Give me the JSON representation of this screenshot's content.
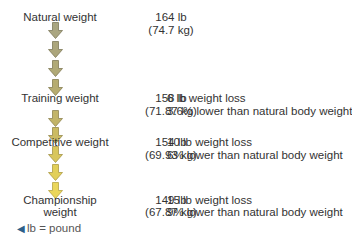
{
  "stages": [
    {
      "label": "Natural weight",
      "lb": "164 lb",
      "kg": "(74.7 kg)",
      "loss": "",
      "pct": ""
    },
    {
      "label": "Training weight",
      "lb": "158 lb",
      "kg": "(71.87 kg)",
      "loss": "6 lb weight loss",
      "pct": "3.6% lower than natural body weight"
    },
    {
      "label": "Competitive weight",
      "lb": "154 lb",
      "kg": "(69.93 kg)",
      "loss": "10 lb weight loss",
      "pct": "6% lower than natural body weight"
    },
    {
      "label_line1": "Championship",
      "label_line2": "weight",
      "lb": "149 lb",
      "kg": "(67.87 kg)",
      "loss": "15 lb weight loss",
      "pct": "9% lower than natural body weight"
    }
  ],
  "legend": {
    "icon": "triangle-left-icon",
    "text": "lb = pound"
  },
  "colors": {
    "arrow_olive": "#a9a27a",
    "arrow_mid": "#c9bd6a",
    "arrow_yellow": "#e8d35a",
    "text": "#333333"
  }
}
